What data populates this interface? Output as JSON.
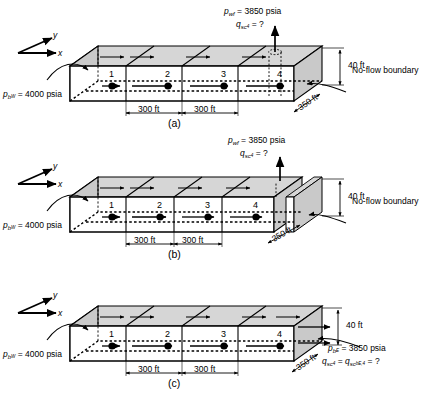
{
  "figure": {
    "panels": [
      {
        "id": "a",
        "caption": "(a)",
        "axes": {
          "y_label": "y",
          "x_label": "x"
        },
        "west_bc": {
          "symbol": "p",
          "sub": "b",
          "sub2": "W",
          "text": "= 4000 psia"
        },
        "well_pressure": {
          "symbol": "p",
          "sub": "wf",
          "text": "= 3850 psia"
        },
        "well_rate": {
          "symbol": "q",
          "sub": "sc",
          "sub2": "4",
          "text": "= ?"
        },
        "east_bc_label": "No-flow boundary",
        "height_label": "40 ft",
        "width_label": "350 ft",
        "spacing_labels": [
          "300 ft",
          "300 ft"
        ],
        "cells": [
          "1",
          "2",
          "3",
          "4"
        ],
        "well_location": "interior-cell-4",
        "has_well_arrow": true,
        "has_end_slab": false
      },
      {
        "id": "b",
        "caption": "(b)",
        "axes": {
          "y_label": "y",
          "x_label": "x"
        },
        "west_bc": {
          "symbol": "p",
          "sub": "b",
          "sub2": "W",
          "text": "= 4000 psia"
        },
        "well_pressure": {
          "symbol": "p",
          "sub": "wf",
          "text": "= 3850 psia"
        },
        "well_rate": {
          "symbol": "q",
          "sub": "sc",
          "sub2": "4",
          "text": "= ?"
        },
        "east_bc_label": "No-flow boundary",
        "height_label": "40 ft",
        "width_label": "350 ft",
        "spacing_labels": [
          "300 ft",
          "300 ft"
        ],
        "cells": [
          "1",
          "2",
          "3",
          "4"
        ],
        "well_location": "east-boundary-face",
        "has_well_arrow": true,
        "has_end_slab": true
      },
      {
        "id": "c",
        "caption": "(c)",
        "axes": {
          "y_label": "y",
          "x_label": "x"
        },
        "west_bc": {
          "symbol": "p",
          "sub": "b",
          "sub2": "W",
          "text": "= 4000 psia"
        },
        "east_pressure": {
          "symbol": "p",
          "sub": "b",
          "sub2": "E",
          "text": "= 3850 psia"
        },
        "east_rate": {
          "symbol": "q",
          "sub": "sc",
          "sub2": "4",
          "eq_symbol": "q",
          "eq_sub": "sc",
          "eq_sub2": "b",
          "eq_sub3": "E,4",
          "text": "= ?"
        },
        "height_label": "40 ft",
        "width_label": "350 ft",
        "spacing_labels": [
          "300 ft",
          "300 ft"
        ],
        "cells": [
          "1",
          "2",
          "3",
          "4"
        ],
        "well_location": "none",
        "has_well_arrow": false,
        "has_end_slab": false
      }
    ],
    "colors": {
      "shade_face": "#c9c9c9",
      "shade_top": "#d6d6d6",
      "outline": "#000000",
      "background": "#ffffff"
    }
  }
}
